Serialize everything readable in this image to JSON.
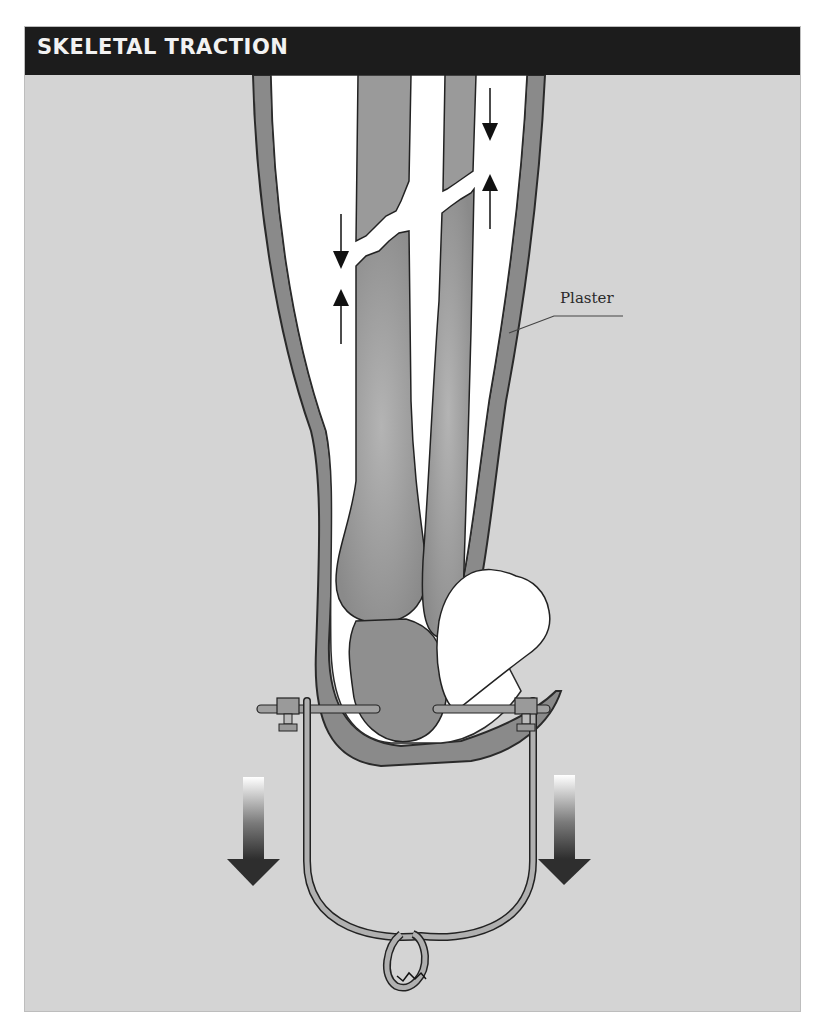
{
  "header": {
    "title": "SKELETAL TRACTION"
  },
  "labels": {
    "plaster": "Plaster"
  },
  "illustration": {
    "subject": "lower leg in plaster cast with fractured tibia and fibula, calcaneal pin attached to traction stirrup",
    "icons": [
      "compression-arrow-down-icon",
      "compression-arrow-up-icon",
      "traction-arrow-left-icon",
      "traction-arrow-right-icon"
    ]
  },
  "colors": {
    "header_bg": "#1c1c1c",
    "header_text": "#f2f2f2",
    "panel_bg": "#d4d4d4",
    "cast": "#8e8e8e",
    "bone": "#9a9a9a",
    "padding": "#ffffff"
  }
}
